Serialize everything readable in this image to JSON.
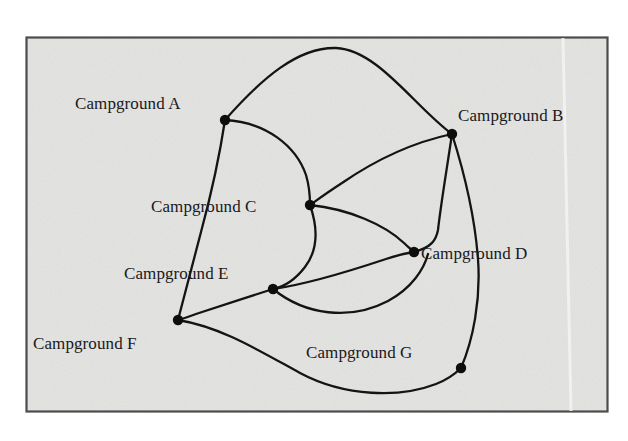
{
  "figure": {
    "kind": "graph-diagram",
    "background_color": "#ffffff",
    "panel_color": "#e3e3e1",
    "frame_color": "#4c4c4c",
    "edge_color": "#141414",
    "node_color": "#0d0d0d",
    "label_color": "#19191c",
    "panel": {
      "x": 26,
      "y": 37,
      "width": 582,
      "height": 375
    }
  },
  "nodes": [
    {
      "id": "A",
      "label": "Campground A",
      "x": 225,
      "y": 120,
      "r": 5.2,
      "label_x": 75,
      "label_y": 95,
      "label_anchor": "left"
    },
    {
      "id": "B",
      "label": "Campground B",
      "x": 452,
      "y": 134,
      "r": 5.2,
      "label_x": 458,
      "label_y": 107,
      "label_anchor": "left"
    },
    {
      "id": "C",
      "label": "Campground C",
      "x": 310,
      "y": 205,
      "r": 5.2,
      "label_x": 151,
      "label_y": 198,
      "label_anchor": "left"
    },
    {
      "id": "D",
      "label": "Campground D",
      "x": 414,
      "y": 252,
      "r": 5.2,
      "label_x": 421,
      "label_y": 245,
      "label_anchor": "left"
    },
    {
      "id": "E",
      "label": "Campground E",
      "x": 273,
      "y": 289,
      "r": 5.2,
      "label_x": 124,
      "label_y": 265,
      "label_anchor": "left"
    },
    {
      "id": "F",
      "label": "Campground F",
      "x": 178,
      "y": 320,
      "r": 5.2,
      "label_x": 33,
      "label_y": 335,
      "label_anchor": "left"
    },
    {
      "id": "G",
      "label": "Campground G",
      "x": 461,
      "y": 368,
      "r": 5.2,
      "label_x": 306,
      "label_y": 344,
      "label_anchor": "left"
    }
  ],
  "edges": [
    {
      "id": "A-B",
      "from": "A",
      "to": "B",
      "path": "M 225 120 C 262 78 298 47 336 48 C 378 50 414 106 452 134"
    },
    {
      "id": "A-C",
      "from": "A",
      "to": "C",
      "path": "M 225 120 C 266 122 296 146 306 175 C 309 185 310 196 310 205"
    },
    {
      "id": "A-F",
      "from": "A",
      "to": "F",
      "path": "M 225 120 C 219 160 211 195 201 232 C 192 267 184 296 178 320"
    },
    {
      "id": "B-C",
      "from": "B",
      "to": "C",
      "path": "M 452 134 C 410 143 371 163 342 183 C 328 192 317 200 310 205"
    },
    {
      "id": "B-D",
      "from": "B",
      "to": "D",
      "path": "M 452 134 C 447 168 441 203 438 230 C 436 240 432 247 414 252"
    },
    {
      "id": "B-G",
      "from": "B",
      "to": "G",
      "path": "M 452 134 C 465 175 475 219 478 259 C 481 300 473 340 461 368"
    },
    {
      "id": "C-E",
      "from": "C",
      "to": "E",
      "path": "M 310 205 C 318 228 318 250 305 267 C 295 280 283 287 273 289"
    },
    {
      "id": "C-D",
      "from": "C",
      "to": "D",
      "path": "M 310 205 C 349 209 385 225 404 243 C 409 248 412 250 414 252"
    },
    {
      "id": "E-D",
      "from": "E",
      "to": "D",
      "path": "M 273 289 C 309 284 350 271 386 259 C 398 255 407 253 414 252"
    },
    {
      "id": "E-F",
      "from": "E",
      "to": "F",
      "path": "M 273 289 C 248 297 220 306 196 314 C 188 317 182 319 178 320"
    },
    {
      "id": "E-D-lower",
      "from": "E",
      "to": "D",
      "path": "M 273 289 C 305 315 350 321 388 301 C 412 288 424 269 428 254"
    },
    {
      "id": "F-G",
      "from": "F",
      "to": "G",
      "path": "M 178 320 C 221 327 258 350 300 373 C 345 397 400 398 436 384 C 449 379 456 373 461 368"
    }
  ]
}
